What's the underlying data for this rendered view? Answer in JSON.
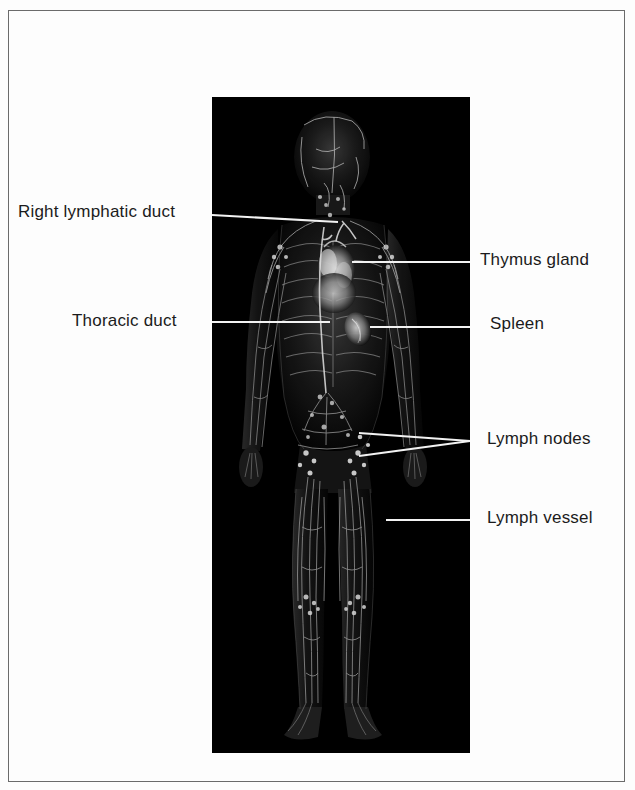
{
  "figure": {
    "background_color": "#fdfdfd",
    "plate_color": "#000000",
    "border_color": "#6b6b6b",
    "leader_color": "#f2f2f2",
    "text_color": "#1b1b1b"
  },
  "labels": {
    "right_lymphatic_duct": "Right lymphatic duct",
    "thoracic_duct": "Thoracic duct",
    "thymus_gland": "Thymus gland",
    "spleen": "Spleen",
    "lymph_nodes": "Lymph nodes",
    "lymph_vessel": "Lymph vessel"
  },
  "callouts": [
    {
      "id": "right-lymphatic-duct",
      "label": "Right lymphatic duct",
      "side": "left",
      "text_x": 18,
      "text_y": 203,
      "line": {
        "x1": 212,
        "y1": 215,
        "x2": 338,
        "y2": 222
      }
    },
    {
      "id": "thoracic-duct",
      "label": "Thoracic duct",
      "side": "left",
      "text_x": 72,
      "text_y": 312,
      "line": {
        "x1": 212,
        "y1": 322,
        "x2": 330,
        "y2": 322
      }
    },
    {
      "id": "thymus-gland",
      "label": "Thymus gland",
      "side": "right",
      "text_x": 480,
      "text_y": 251,
      "line": {
        "x1": 352,
        "y1": 262,
        "x2": 470,
        "y2": 262
      }
    },
    {
      "id": "spleen",
      "label": "Spleen",
      "side": "right",
      "text_x": 490,
      "text_y": 315,
      "line": {
        "x1": 370,
        "y1": 327,
        "x2": 470,
        "y2": 327
      }
    },
    {
      "id": "lymph-nodes",
      "label": "Lymph nodes",
      "side": "right",
      "text_x": 487,
      "text_y": 430,
      "lines": [
        {
          "x1": 359,
          "y1": 433,
          "x2": 470,
          "y2": 441
        },
        {
          "x1": 359,
          "y1": 456,
          "x2": 470,
          "y2": 441
        }
      ]
    },
    {
      "id": "lymph-vessel",
      "label": "Lymph vessel",
      "side": "right",
      "text_x": 487,
      "text_y": 509,
      "line": {
        "x1": 386,
        "y1": 520,
        "x2": 470,
        "y2": 520
      }
    }
  ],
  "anatomy": {
    "subject": "human-figure-anterior-view",
    "structures": [
      "head",
      "neck",
      "shoulders",
      "arms",
      "hands",
      "ribcage",
      "thymus",
      "spleen",
      "thoracic-duct",
      "abdominal-lymph-trunks",
      "inguinal-lymph-nodes",
      "legs",
      "knees",
      "feet",
      "superficial-lymph-vessels"
    ]
  }
}
